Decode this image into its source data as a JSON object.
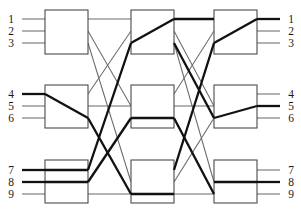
{
  "diagram": {
    "type": "clos-network",
    "stage_count": 3,
    "switches_per_stage": 3,
    "ports_per_switch": 3,
    "colors": {
      "box_stroke": "#4a4a4a",
      "link_thin": "#6b6b6b",
      "link_thick": "#111111",
      "background": "#ffffff",
      "label": "#1a1a1a"
    },
    "inputs": {
      "group_top": [
        "1",
        "2",
        "3"
      ],
      "group_middle": [
        "4",
        "5",
        "6"
      ],
      "group_bottom": [
        "7",
        "8",
        "9"
      ]
    },
    "outputs": {
      "group_top": [
        "1",
        "2",
        "3"
      ],
      "group_middle": [
        "4",
        "5",
        "6"
      ],
      "group_bottom": [
        "7",
        "8",
        "9"
      ]
    },
    "input_labels": [
      "1",
      "2",
      "3",
      "4",
      "5",
      "6",
      "7",
      "8",
      "9"
    ],
    "output_labels": [
      "1",
      "2",
      "3",
      "4",
      "5",
      "6",
      "7",
      "8",
      "9"
    ],
    "switch_names": [
      "stage1-switch-a",
      "stage1-switch-b",
      "stage1-switch-c",
      "stage2-switch-a",
      "stage2-switch-b",
      "stage2-switch-c",
      "stage3-switch-a",
      "stage3-switch-b",
      "stage3-switch-c"
    ],
    "highlighted_paths": [
      {
        "from": "4",
        "to": "1",
        "label": "active-path-4-to-1"
      },
      {
        "from": "7",
        "to": "5",
        "label": "active-path-7-to-5"
      },
      {
        "from": "8",
        "to": "8",
        "label": "active-path-8-to-8"
      }
    ]
  }
}
